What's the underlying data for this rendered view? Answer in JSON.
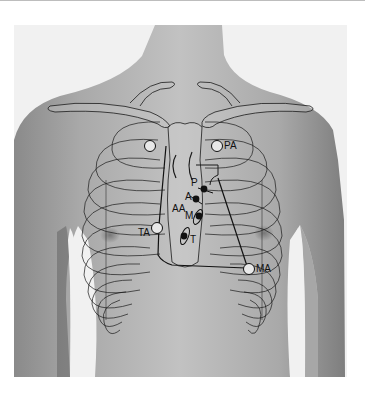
{
  "figure": {
    "labels": {
      "pa": "PA",
      "p": "P",
      "a": "A",
      "aa": "AA",
      "m": "M",
      "t": "T",
      "ta": "TA",
      "ma": "MA"
    }
  },
  "colors": {
    "background": "#ffffff",
    "skin_light": "#b9b9b9",
    "skin_dark": "#6e6e6e",
    "outline": "#1a1a1a"
  }
}
